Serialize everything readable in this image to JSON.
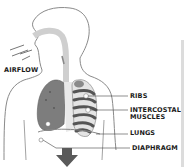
{
  "diagram": {
    "labels": {
      "airflow": "AIRFLOW",
      "ribs": "RIBS",
      "intercostal_line1": "INTERCOSTAL",
      "intercostal_line2": "MUSCLES",
      "lungs": "LUNGS",
      "diaphragm": "DIAPHRAGM"
    },
    "arrow_direction": "down",
    "colors": {
      "outline": "#8a8a8a",
      "lung": "#7d7d7d",
      "ribs": "#555555",
      "airway": "#cfcfcf",
      "arrow": "#5a5a5a",
      "text": "#1a1a1a"
    }
  }
}
